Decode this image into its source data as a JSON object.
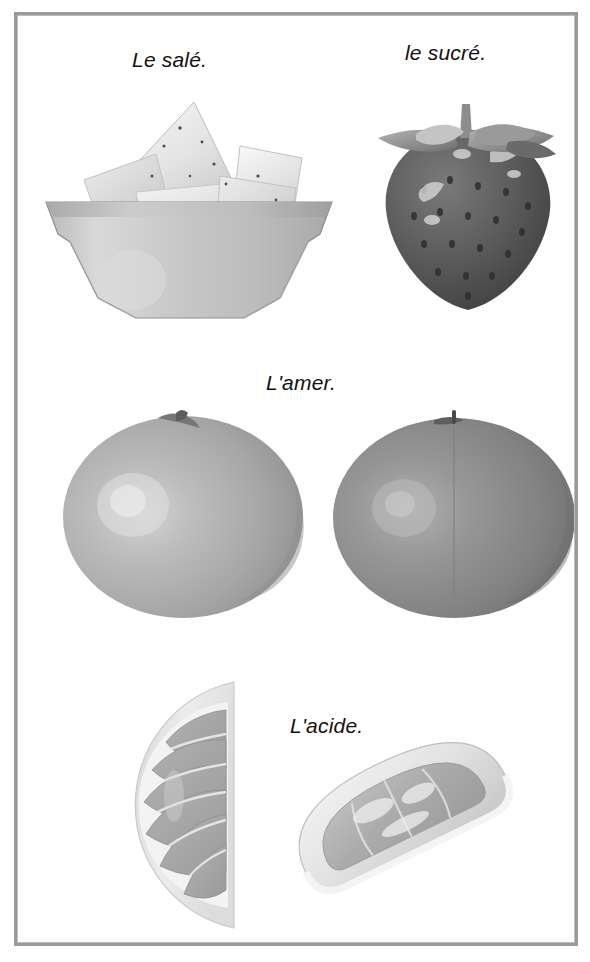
{
  "page": {
    "background_color": "#ffffff",
    "frame_color": "#9a9a9a",
    "text_color": "#14110f",
    "rendering": "grayscale photographs"
  },
  "rows": [
    {
      "id": "row-salty-sweet",
      "items": [
        {
          "id": "salty",
          "caption": "Le salé.",
          "image_name": "bowl-of-tortilla-chips-photo",
          "subject": "bowl of tortilla chips"
        },
        {
          "id": "sweet",
          "caption": "le sucré.",
          "image_name": "strawberry-photo",
          "subject": "strawberry"
        }
      ]
    },
    {
      "id": "row-bitter",
      "items": [
        {
          "id": "bitter",
          "caption": "L'amer.",
          "image_name": "grapefruit-left-photo",
          "subject": "whole grapefruit"
        },
        {
          "id": "bitter-2",
          "caption": "",
          "image_name": "grapefruit-right-photo",
          "subject": "whole grapefruit"
        }
      ]
    },
    {
      "id": "row-sour",
      "items": [
        {
          "id": "sour",
          "caption": "L'acide.",
          "image_name": "lemon-half-slice-photo",
          "subject": "half lemon slice"
        },
        {
          "id": "sour-2",
          "caption": "",
          "image_name": "lemon-wedge-photo",
          "subject": "lemon wedge"
        }
      ]
    }
  ],
  "captions": {
    "salty": "Le salé.",
    "sweet": "le sucré.",
    "bitter": "L'amer.",
    "sour": "L'acide."
  }
}
